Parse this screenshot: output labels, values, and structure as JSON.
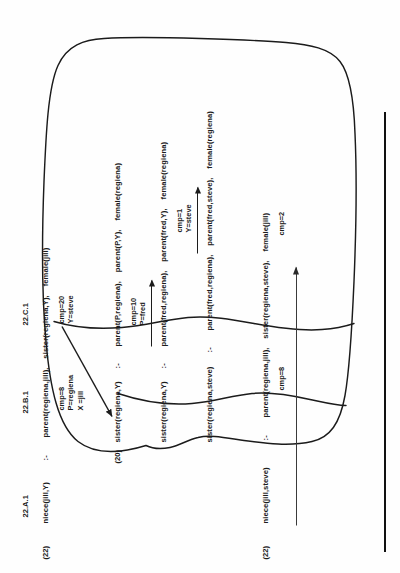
{
  "figure": {
    "kind": "scanned-derivation-trace",
    "orientation": "rotated-90-ccw",
    "ink_color": "#1c1c1c",
    "paper_color": "#fefefe"
  },
  "column_headers": [
    {
      "id": "a",
      "label": "22.A.1"
    },
    {
      "id": "b",
      "label": "22.B.1"
    },
    {
      "id": "c",
      "label": "22.C.1"
    }
  ],
  "goal_marks": [
    {
      "id": "top",
      "label": "(22)"
    },
    {
      "id": "bottom",
      "label": "(22)"
    }
  ],
  "step_marks": [
    {
      "id": "s20",
      "label": "(20)"
    }
  ],
  "lines": [
    {
      "id": "l1",
      "head": "niece(jill,Y)",
      "neck": ":-",
      "body": "parent(regiena,jill),    sister(regiena,Y),    female(jill)"
    },
    {
      "id": "l2",
      "head": "sister(regiena,Y)",
      "neck": ":-",
      "body": "parent(P,regiena),    parent(P,Y),    female(regiena)"
    },
    {
      "id": "l3",
      "head": "sister(regiena,Y)",
      "neck": ":-",
      "body": "parent(fred,regiena),    parent(fred,Y),    female(regiena)"
    },
    {
      "id": "l4",
      "head": "sister(regiena,steve)",
      "neck": ":-",
      "body": "parent(fred,regiena),    parent(fred,steve),    female(regiena)"
    },
    {
      "id": "l5",
      "head": "niece(jill,steve)",
      "neck": ":-",
      "body": "parent(regiena,jill),    sister(regiena,steve),    female(jill)"
    }
  ],
  "annotations": [
    {
      "id": "a1",
      "text": "cmp=8\nP=regiena\nX =jill"
    },
    {
      "id": "a2",
      "text": "cmp=20\nY=steve"
    },
    {
      "id": "a3",
      "text": "cmp=10\nP=fred"
    },
    {
      "id": "a4",
      "text": "cmp=1\nY=steve"
    },
    {
      "id": "a5",
      "text": "cmp=8"
    },
    {
      "id": "a6",
      "text": "cmp=2"
    }
  ]
}
